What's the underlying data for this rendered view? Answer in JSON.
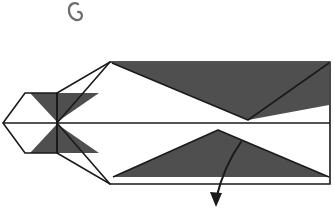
{
  "canvas": {
    "width": 334,
    "height": 214,
    "background_color": "#ffffff"
  },
  "figure": {
    "stroke_color": "#1a1a1a",
    "shade_color": "#4f4f4f",
    "paper_color": "#ffffff",
    "stroke_width": "1.6"
  },
  "parts": {
    "hook_mark": {
      "name": "hook-glyph",
      "label": "hook",
      "color": "#6e6e6e",
      "path": "M 78 4 C 74 2, 69.5 4, 69 9 C 68.4 14.5, 71.6 18.4, 75 19.6 C 78.6 20.9, 81.6 19.2, 81.9 16.2 C 82.2 13.4, 80.2 11.6, 78.1 11.9",
      "stroke_width": "2.3"
    },
    "center_crease": {
      "name": "center-crease-line",
      "label": "center crease",
      "y": 123,
      "x_start": 3,
      "x_end": 330
    },
    "head": {
      "name": "head-parallelogram",
      "label": "head",
      "fill": "#ffffff",
      "points": "3,123 25,93 57,93 57,153 25,153"
    },
    "body_outline": {
      "name": "body-outline",
      "label": "body",
      "fill": "#ffffff",
      "points": "110,62 330,62 330,184 110,184 57,153 57,93"
    },
    "upper_shade": {
      "name": "upper-shaded-flap",
      "label": "upper shaded flap",
      "fill": "#4f4f4f",
      "points": "112,63 329,63 329,105 248,120"
    },
    "lower_shade": {
      "name": "lower-shaded-flap",
      "label": "lower shaded flap",
      "fill": "#4f4f4f",
      "points": "218,130 329,177 113,177"
    },
    "head_upper_shade": {
      "name": "head-upper-shaded-wedge",
      "label": "head upper wedge",
      "fill": "#4f4f4f",
      "points": "30,93 99,93 57,122"
    },
    "head_lower_shade": {
      "name": "head-lower-shaded-wedge",
      "label": "head lower wedge",
      "fill": "#4f4f4f",
      "points": "57,124 99,153 30,153"
    },
    "head_fold_upper": {
      "name": "head-fold-line-upper",
      "label": "upper fold line",
      "path": "M 57 123 L 110 62"
    },
    "head_fold_lower": {
      "name": "head-fold-line-lower",
      "label": "lower fold line",
      "path": "M 57 123 L 110 184"
    },
    "arrow": {
      "name": "fold-direction-arrow",
      "label": "fold direction",
      "color": "#1a1a1a",
      "path": "M 241 142 C 231 156, 222 174, 216 199",
      "head_points": "216,207 210,192 222,193",
      "stroke_width": "2.1"
    }
  }
}
